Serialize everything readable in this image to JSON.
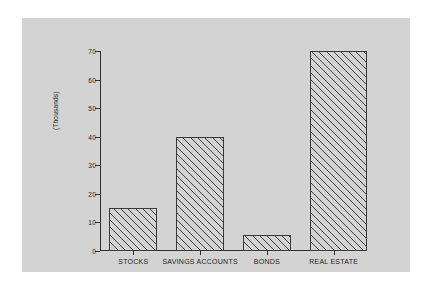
{
  "chart_data": {
    "type": "bar",
    "title": "",
    "subtitle": "",
    "xlabel": "",
    "ylabel": "(Thousands)",
    "categories": [
      "STOCKS",
      "SAVINGS ACCOUNTS",
      "BONDS",
      "REAL ESTATE"
    ],
    "values": [
      15,
      40,
      5.5,
      70
    ],
    "ylim": [
      0,
      70
    ],
    "yticks": [
      0,
      10,
      20,
      30,
      40,
      50,
      60,
      70
    ],
    "ytick_labels": [
      "0",
      "10",
      "20",
      "30",
      "40",
      "50",
      "60",
      "70"
    ],
    "grid": false,
    "legend": null,
    "bar_fill": "hatch-diagonal",
    "colors": {
      "panel_background": "#d3d3d3",
      "figure_background": "#ffffff",
      "axis_line": "#2e2e2e",
      "bar_edge": "#3a3a3a",
      "hatch_line": "#3f3f3f",
      "text": "#1d1d1d"
    }
  }
}
